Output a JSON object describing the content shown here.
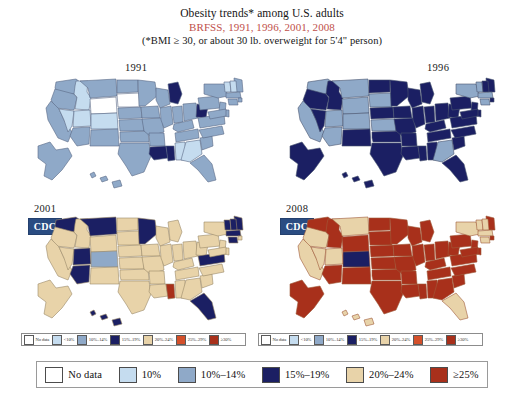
{
  "figure": {
    "title_line1": "Obesity trends* among U.S. adults",
    "title_line2": "BRFSS, 1991, 1996, 2001, 2008",
    "title_line3": "(*BMI ≥ 30, or about 30 lb. overweight for 5'4\" person)",
    "title_accent_color": "#c0504a",
    "background": "#ffffff"
  },
  "palette": {
    "no_data": "#ffffff",
    "lt10": "#c5dcef",
    "p10_14": "#8fa9c8",
    "p15_19": "#1b1f63",
    "p20_24": "#e8d3a9",
    "p25_29": "#d4502a",
    "ge30": "#a8301b",
    "ge25": "#a8301b"
  },
  "panels": [
    {
      "id": "panel-1991",
      "year": "1991",
      "cdc_logo": null,
      "legend": [
        {
          "label": "No data",
          "color": "#ffffff"
        },
        {
          "label": "<10%",
          "color": "#c5dcef"
        },
        {
          "label": "10%–14%",
          "color": "#8fa9c8"
        },
        {
          "label": "15%–19%",
          "color": "#1b1f63"
        },
        {
          "label": "20%–24%",
          "color": "#e8d3a9"
        },
        {
          "label": "25%–29%",
          "color": "#d4502a"
        },
        {
          "label": "≥30%",
          "color": "#a8301b"
        }
      ]
    },
    {
      "id": "panel-1996",
      "year": "1996",
      "cdc_logo": null,
      "legend": [
        {
          "label": "No data",
          "color": "#ffffff"
        },
        {
          "label": "<10%",
          "color": "#c5dcef"
        },
        {
          "label": "10%–14%",
          "color": "#8fa9c8"
        },
        {
          "label": "15%–19%",
          "color": "#1b1f63"
        },
        {
          "label": "20%–24%",
          "color": "#e8d3a9"
        },
        {
          "label": "25%–29%",
          "color": "#d4502a"
        },
        {
          "label": "≥30%",
          "color": "#a8301b"
        }
      ]
    },
    {
      "id": "panel-2001",
      "year": "2001",
      "cdc_logo": "CDC",
      "legend": [
        {
          "label": "No data",
          "color": "#ffffff"
        },
        {
          "label": "<10%",
          "color": "#c5dcef"
        },
        {
          "label": "10%–14%",
          "color": "#8fa9c8"
        },
        {
          "label": "15%–19%",
          "color": "#1b1f63"
        },
        {
          "label": "20%–24%",
          "color": "#e8d3a9"
        },
        {
          "label": "25%–29%",
          "color": "#d4502a"
        },
        {
          "label": "≥30%",
          "color": "#a8301b"
        }
      ]
    },
    {
      "id": "panel-2008",
      "year": "2008",
      "cdc_logo": "CDC",
      "legend": [
        {
          "label": "No data",
          "color": "#ffffff"
        },
        {
          "label": "<10%",
          "color": "#c5dcef"
        },
        {
          "label": "10%–14%",
          "color": "#8fa9c8"
        },
        {
          "label": "15%–19%",
          "color": "#1b1f63"
        },
        {
          "label": "20%–24%",
          "color": "#e8d3a9"
        },
        {
          "label": "25%–29%",
          "color": "#d4502a"
        },
        {
          "label": "≥30%",
          "color": "#a8301b"
        }
      ]
    }
  ],
  "main_legend": [
    {
      "label": "No data",
      "color": "#ffffff"
    },
    {
      "label": "10%",
      "color": "#c5dcef"
    },
    {
      "label": "10%–14%",
      "color": "#8fa9c8"
    },
    {
      "label": "15%–19%",
      "color": "#1b1f63"
    },
    {
      "label": "20%–24%",
      "color": "#e8d3a9"
    },
    {
      "label": "≥25%",
      "color": "#a8301b"
    }
  ],
  "chart_data": {
    "type": "map",
    "title": "Obesity trends* among U.S. adults",
    "subtitle": "BRFSS, 1991, 1996, 2001, 2008",
    "note": "(*BMI ≥ 30, or about 30 lb. overweight for 5'4\" person)",
    "source": "BRFSS",
    "legend_position": "bottom",
    "categories": [
      "No data",
      "10%",
      "10%–14%",
      "15%–19%",
      "20%–24%",
      "≥25%"
    ],
    "years": [
      "1991",
      "1996",
      "2001",
      "2008"
    ],
    "series": [
      {
        "name": "1991",
        "dominant_category": "10%–14%",
        "state_values": {
          "WA": "10%–14%",
          "OR": "10%–14%",
          "CA": "10%–14%",
          "NV": "10%",
          "ID": "10%",
          "MT": "10%–14%",
          "WY": "No data",
          "UT": "10%",
          "AZ": "10%–14%",
          "CO": "10%",
          "NM": "10%–14%",
          "ND": "10%–14%",
          "SD": "No data",
          "NE": "10%–14%",
          "KS": "10%–14%",
          "OK": "10%–14%",
          "TX": "10%–14%",
          "MN": "10%–14%",
          "IA": "10%–14%",
          "MO": "10%–14%",
          "AR": "10%–14%",
          "LA": "15%–19%",
          "WI": "10%–14%",
          "IL": "10%–14%",
          "MS": "15%–19%",
          "MI": "15%–19%",
          "IN": "10%–14%",
          "KY": "10%–14%",
          "TN": "10%–14%",
          "AL": "10%",
          "OH": "10%–14%",
          "WV": "15%–19%",
          "GA": "10%",
          "FL": "10%–14%",
          "SC": "10%–14%",
          "NC": "10%–14%",
          "VA": "10%–14%",
          "PA": "10%–14%",
          "NY": "10%–14%",
          "ME": "10%–14%",
          "VT": "10%",
          "NH": "10%",
          "MA": "10%–14%",
          "RI": "10%–14%",
          "CT": "10%–14%",
          "NJ": "10%–14%",
          "DE": "10%–14%",
          "MD": "10%–14%",
          "AK": "10%–14%",
          "HI": "10%–14%"
        }
      },
      {
        "name": "1996",
        "dominant_category": "15%–19%",
        "state_values": {
          "WA": "10%–14%",
          "OR": "15%–19%",
          "CA": "10%–14%",
          "NV": "15%–19%",
          "ID": "15%–19%",
          "MT": "10%–14%",
          "WY": "10%–14%",
          "UT": "10%–14%",
          "AZ": "10%–14%",
          "CO": "10%–14%",
          "NM": "15%–19%",
          "ND": "15%–19%",
          "SD": "10%–14%",
          "NE": "15%–19%",
          "KS": "10%–14%",
          "OK": "15%–19%",
          "TX": "15%–19%",
          "MN": "15%–19%",
          "IA": "15%–19%",
          "MO": "15%–19%",
          "AR": "15%–19%",
          "LA": "15%–19%",
          "WI": "15%–19%",
          "IL": "15%–19%",
          "MS": "15%–19%",
          "MI": "15%–19%",
          "IN": "15%–19%",
          "KY": "15%–19%",
          "TN": "15%–19%",
          "AL": "15%–19%",
          "OH": "15%–19%",
          "WV": "15%–19%",
          "GA": "10%–14%",
          "FL": "15%–19%",
          "SC": "15%–19%",
          "NC": "15%–19%",
          "VA": "15%–19%",
          "PA": "15%–19%",
          "NY": "10%–14%",
          "ME": "15%–19%",
          "VT": "10%–14%",
          "NH": "15%–19%",
          "MA": "10%–14%",
          "RI": "15%–19%",
          "CT": "10%–14%",
          "NJ": "15%–19%",
          "DE": "15%–19%",
          "MD": "15%–19%",
          "AK": "15%–19%",
          "HI": "15%–19%"
        }
      },
      {
        "name": "2001",
        "dominant_category": "20%–24%",
        "state_values": {
          "WA": "15%–19%",
          "OR": "20%–24%",
          "CA": "20%–24%",
          "NV": "20%–24%",
          "ID": "20%–24%",
          "MT": "15%–19%",
          "WY": "20%–24%",
          "UT": "15%–19%",
          "AZ": "15%–19%",
          "CO": "10%–14%",
          "NM": "20%–24%",
          "ND": "20%–24%",
          "SD": "20%–24%",
          "NE": "20%–24%",
          "KS": "20%–24%",
          "OK": "20%–24%",
          "TX": "20%–24%",
          "MN": "15%–19%",
          "IA": "20%–24%",
          "MO": "20%–24%",
          "AR": "20%–24%",
          "LA": "20%–24%",
          "WI": "20%–24%",
          "IL": "20%–24%",
          "MS": "≥25%",
          "MI": "20%–24%",
          "IN": "20%–24%",
          "KY": "20%–24%",
          "TN": "20%–24%",
          "AL": "20%–24%",
          "OH": "20%–24%",
          "WV": "20%–24%",
          "GA": "20%–24%",
          "FL": "15%–19%",
          "SC": "20%–24%",
          "NC": "20%–24%",
          "VA": "15%–19%",
          "PA": "20%–24%",
          "NY": "20%–24%",
          "ME": "15%–19%",
          "VT": "15%–19%",
          "NH": "15%–19%",
          "MA": "15%–19%",
          "RI": "20%–24%",
          "CT": "15%–19%",
          "NJ": "20%–24%",
          "DE": "20%–24%",
          "MD": "20%–24%",
          "AK": "20%–24%",
          "HI": "15%–19%"
        }
      },
      {
        "name": "2008",
        "dominant_category": "≥25%",
        "state_values": {
          "WA": "≥25%",
          "OR": "20%–24%",
          "CA": "20%–24%",
          "NV": "20%–24%",
          "ID": "≥25%",
          "MT": "20%–24%",
          "WY": "≥25%",
          "UT": "20%–24%",
          "AZ": "≥25%",
          "CO": "15%–19%",
          "NM": "≥25%",
          "ND": "≥25%",
          "SD": "≥25%",
          "NE": "≥25%",
          "KS": "≥25%",
          "OK": "≥25%",
          "TX": "≥25%",
          "MN": "≥25%",
          "IA": "≥25%",
          "MO": "≥25%",
          "AR": "≥25%",
          "LA": "≥25%",
          "WI": "≥25%",
          "IL": "≥25%",
          "MS": "≥25%",
          "MI": "≥25%",
          "IN": "≥25%",
          "KY": "≥25%",
          "TN": "≥25%",
          "AL": "≥25%",
          "OH": "≥25%",
          "WV": "≥25%",
          "GA": "≥25%",
          "FL": "20%–24%",
          "SC": "≥25%",
          "NC": "≥25%",
          "VA": "≥25%",
          "PA": "≥25%",
          "NY": "20%–24%",
          "ME": "≥25%",
          "VT": "20%–24%",
          "NH": "20%–24%",
          "MA": "20%–24%",
          "RI": "≥25%",
          "CT": "20%–24%",
          "NJ": "≥25%",
          "DE": "≥25%",
          "MD": "≥25%",
          "AK": "≥25%",
          "HI": "20%–24%"
        }
      }
    ]
  }
}
